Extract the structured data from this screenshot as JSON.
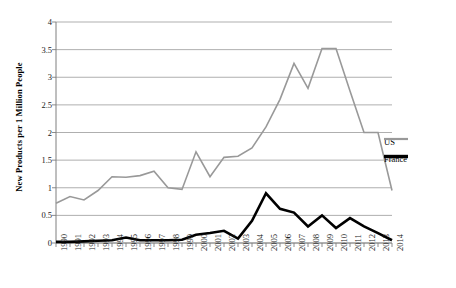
{
  "chart_data": {
    "type": "line",
    "title": "",
    "xlabel": "",
    "ylabel": "New Products per 1 Million People",
    "x": [
      1990,
      1991,
      1992,
      1993,
      1994,
      1995,
      1996,
      1997,
      1998,
      1999,
      2000,
      2001,
      2002,
      2003,
      2004,
      2005,
      2006,
      2007,
      2008,
      2009,
      2010,
      2011,
      2012,
      2013,
      2014
    ],
    "categories": [
      "1990",
      "1991",
      "1992",
      "1993",
      "1994",
      "1995",
      "1996",
      "1997",
      "1998",
      "1999",
      "2000",
      "2001",
      "2002",
      "2003",
      "2004",
      "2005",
      "2006",
      "2007",
      "2008",
      "2009",
      "2010",
      "2011",
      "2012",
      "2013",
      "2014"
    ],
    "xlim": [
      1990,
      2014
    ],
    "ylim": [
      0,
      4
    ],
    "yticks": [
      0,
      0.5,
      1,
      1.5,
      2,
      2.5,
      3,
      3.5,
      4
    ],
    "ytick_labels": [
      "0",
      "0.5",
      "1",
      "1.5",
      "2",
      "2.5",
      "3",
      "3.5",
      "4"
    ],
    "grid": true,
    "legend_position": "right",
    "series": [
      {
        "name": "US",
        "color": "#999999",
        "width": 1.6,
        "values": [
          0.72,
          0.84,
          0.78,
          0.95,
          1.2,
          1.19,
          1.22,
          1.3,
          1.0,
          0.97,
          1.65,
          1.2,
          1.55,
          1.57,
          1.72,
          2.1,
          2.6,
          3.25,
          2.8,
          3.52,
          3.52,
          2.75,
          2.0,
          2.0,
          0.95
        ]
      },
      {
        "name": "France",
        "color": "#000000",
        "width": 2.6,
        "values": [
          0.02,
          0.02,
          0.03,
          0.04,
          0.05,
          0.1,
          0.05,
          0.05,
          0.05,
          0.06,
          0.15,
          0.18,
          0.22,
          0.08,
          0.4,
          0.9,
          0.62,
          0.55,
          0.3,
          0.5,
          0.27,
          0.45,
          0.3,
          0.18,
          0.05
        ]
      }
    ]
  },
  "legend": {
    "entries": [
      {
        "label": "US",
        "color": "#999999"
      },
      {
        "label": "France",
        "color": "#000000"
      }
    ]
  }
}
